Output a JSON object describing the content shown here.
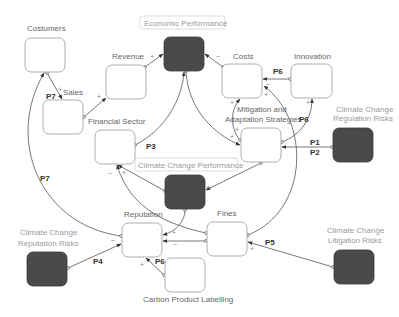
{
  "nodes": {
    "costumers": "Costumers",
    "sales": "Sales",
    "revenue": "Revenue",
    "economic_performance": "Economic Performance",
    "costs": "Costs",
    "innovation": "Innovation",
    "financial_sector": "Financial Sector",
    "mitigation_line1": "Mitigation and",
    "mitigation_line2": "Adaptation Strategies",
    "cc_regulation_line1": "Climate Change",
    "cc_regulation_line2": "Regulation Risks",
    "cc_performance": "Climate Change Performance",
    "reputation": "Reputation",
    "fines": "Fines",
    "carbon_labelling": "Carbon Product Labelling",
    "cc_reputation_line1": "Climate Change",
    "cc_reputation_line2": "Reputation Risks",
    "cc_litigation_line1": "Climate Change",
    "cc_litigation_line2": "Litigation Risks"
  },
  "edge_labels": {
    "p1": "P1",
    "p2": "P2",
    "p3": "P3",
    "p4": "P4",
    "p5": "P5",
    "p6_innov_costs": "P6",
    "p6_mitig_innov": "P6",
    "p6_carbon": "P6",
    "p7_sales": "P7",
    "p7_loop": "P7"
  },
  "signs": {
    "plus": "+",
    "minus": "–"
  },
  "colors": {
    "dark_node": "#4a4a4a",
    "edge": "#555555",
    "box_stroke": "#9a9a9a"
  }
}
